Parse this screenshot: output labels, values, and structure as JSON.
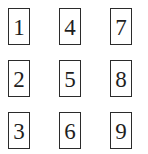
{
  "cards": [
    {
      "label": "1"
    },
    {
      "label": "2"
    },
    {
      "label": "3"
    },
    {
      "label": "4"
    },
    {
      "label": "5"
    },
    {
      "label": "6"
    },
    {
      "label": "7"
    },
    {
      "label": "8"
    },
    {
      "label": "9"
    }
  ],
  "colors": {
    "border": "#2b2b2b",
    "text": "#1e1e1e",
    "background": "#ffffff"
  }
}
